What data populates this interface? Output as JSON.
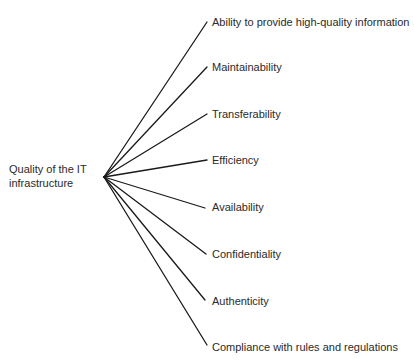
{
  "diagram": {
    "type": "tree",
    "root": {
      "label_line1": "Quality of the IT",
      "label_line2": "infrastructure"
    },
    "branches": [
      {
        "label": "Ability to provide high-quality information"
      },
      {
        "label": "Maintainability"
      },
      {
        "label": "Transferability"
      },
      {
        "label": "Efficiency"
      },
      {
        "label": "Availability"
      },
      {
        "label": "Confidentiality"
      },
      {
        "label": "Authenticity"
      },
      {
        "label": "Compliance with rules and regulations"
      }
    ],
    "colors": {
      "line": "#1a1a1a",
      "text": "#2a2a2a",
      "background": "#ffffff"
    }
  }
}
